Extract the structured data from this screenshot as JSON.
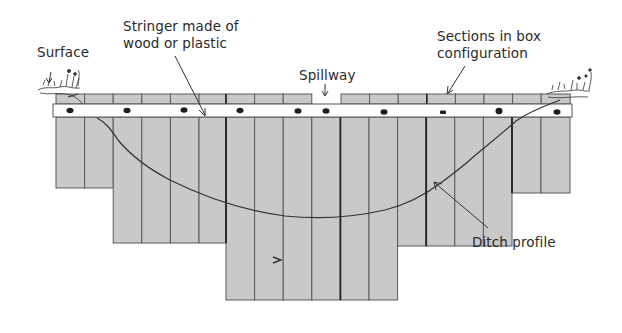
{
  "diagram": {
    "type": "cross-section",
    "labels": {
      "surface": "Surface",
      "stringer_line1": "Stringer made of",
      "stringer_line2": "wood or plastic",
      "spillway": "Spillway",
      "sections_line1": "Sections in  box",
      "sections_line2": "configuration",
      "ditch_profile": "Ditch profile",
      "flow_mark": ">"
    },
    "colors": {
      "board_fill": "#c9c9c9",
      "board_stroke": "#555555",
      "stringer_fill": "#ffffff",
      "profile_line": "#333333",
      "text": "#2a2a2a"
    },
    "structure": {
      "column_count": 18,
      "column_bottoms_px": [
        188,
        188,
        243,
        243,
        243,
        300,
        300,
        300,
        300,
        300,
        300,
        246,
        246,
        246,
        246,
        246,
        193,
        193
      ],
      "spillway_gap_columns": [
        9
      ]
    }
  }
}
